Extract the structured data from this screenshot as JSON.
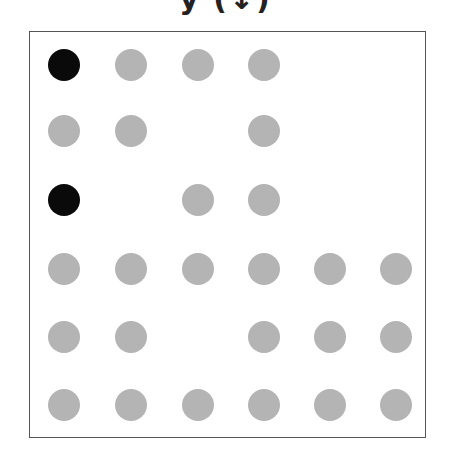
{
  "title": "y (↓)",
  "colors": {
    "filled": "#b4b4b4",
    "highlight": "#0a0a0a",
    "frame": "#555555"
  },
  "grid": {
    "rows": 6,
    "cols": 6,
    "col_centers": [
      34,
      101,
      168,
      234,
      300,
      366
    ],
    "row_centers": [
      33,
      99,
      168,
      237,
      305,
      373
    ],
    "cells": [
      [
        "black",
        "grey",
        "grey",
        "grey",
        "",
        ""
      ],
      [
        "grey",
        "grey",
        "",
        "grey",
        "",
        ""
      ],
      [
        "black",
        "",
        "grey",
        "grey",
        "",
        ""
      ],
      [
        "grey",
        "grey",
        "grey",
        "grey",
        "grey",
        "grey"
      ],
      [
        "grey",
        "grey",
        "",
        "grey",
        "grey",
        "grey"
      ],
      [
        "grey",
        "grey",
        "grey",
        "grey",
        "grey",
        "grey"
      ]
    ]
  }
}
